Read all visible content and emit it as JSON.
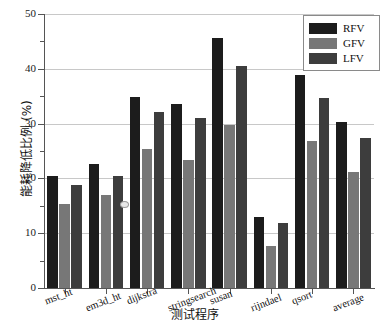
{
  "chart_data": {
    "type": "bar",
    "title": "",
    "xlabel": "测试程序",
    "ylabel": "能耗降低比例 (%)",
    "categories": [
      "mst_ht",
      "em3d_ht",
      "dijkstra",
      "stringsearch",
      "susan",
      "rijndael",
      "qsort",
      "average"
    ],
    "series": [
      {
        "name": "RFV",
        "color": "#1c1c1c",
        "values": [
          20.5,
          22.7,
          34.9,
          33.5,
          45.6,
          12.9,
          38.8,
          30.3
        ]
      },
      {
        "name": "GFV",
        "color": "#777777",
        "values": [
          15.3,
          17.0,
          25.4,
          23.3,
          29.7,
          7.6,
          26.9,
          21.2
        ]
      },
      {
        "name": "LFV",
        "color": "#3d3d3d",
        "values": [
          18.8,
          20.4,
          32.1,
          31.0,
          40.5,
          11.9,
          34.7,
          27.3
        ]
      }
    ],
    "ylim": [
      0,
      50
    ],
    "ytick_major": [
      0,
      10,
      20,
      30,
      40,
      50
    ],
    "ytick_minor": [
      5,
      15,
      25,
      35,
      45
    ],
    "ytick_labels": [
      "0",
      "10",
      "20",
      "30",
      "40",
      "50"
    ],
    "grid": true,
    "grid_axis": "y",
    "legend_position": "top-right",
    "legend_entries": [
      "RFV",
      "GFV",
      "LFV"
    ]
  },
  "axes": {
    "y_title": "能耗降低比例 (%)",
    "x_title": "测试程序"
  },
  "legend": {
    "items": [
      {
        "label": "RFV"
      },
      {
        "label": "GFV"
      },
      {
        "label": "LFV"
      }
    ]
  }
}
